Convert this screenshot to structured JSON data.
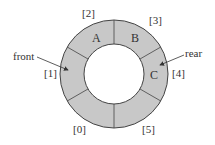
{
  "diagram": {
    "colors": {
      "fill": "#c8c8c8",
      "stroke": "#444444",
      "text": "#333333",
      "background": "#ffffff"
    },
    "ring": {
      "cx": 114,
      "cy": 74,
      "outer_r": 54,
      "inner_r": 30
    },
    "slots": [
      {
        "index": "[0]",
        "value": ""
      },
      {
        "index": "[1]",
        "value": ""
      },
      {
        "index": "[2]",
        "value": "A"
      },
      {
        "index": "[3]",
        "value": "B"
      },
      {
        "index": "[4]",
        "value": "C"
      },
      {
        "index": "[5]",
        "value": ""
      }
    ],
    "pointers": {
      "front": {
        "label": "front",
        "points_to": "[1]"
      },
      "rear": {
        "label": "rear",
        "points_to": "[4]"
      }
    }
  }
}
